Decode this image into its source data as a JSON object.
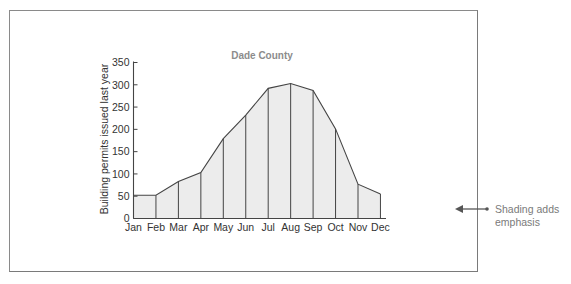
{
  "chart_data": {
    "type": "area",
    "title": "Dade County",
    "xlabel": "",
    "ylabel": "Building permits issued last year",
    "categories": [
      "Jan",
      "Feb",
      "Mar",
      "Apr",
      "May",
      "Jun",
      "Jul",
      "Aug",
      "Sep",
      "Oct",
      "Nov",
      "Dec"
    ],
    "values": [
      52,
      52,
      83,
      103,
      179,
      232,
      292,
      303,
      287,
      201,
      77,
      55
    ],
    "ylim": [
      0,
      350
    ],
    "yticks": [
      0,
      50,
      100,
      150,
      200,
      250,
      300,
      350
    ],
    "grid": false,
    "legend": null,
    "fill_color": "#ececec",
    "line_color": "#444444",
    "annotation": {
      "text_line1": "Shading adds",
      "text_line2": "emphasis",
      "arrow": "left"
    }
  }
}
